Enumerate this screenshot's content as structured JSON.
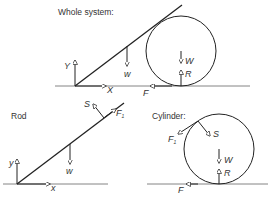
{
  "panels": {
    "whole_system": {
      "title": "Whole system:",
      "labels": {
        "Y": "Y",
        "X": "X",
        "w": "w",
        "W": "W",
        "R": "R",
        "F": "F"
      }
    },
    "rod": {
      "title": "Rod",
      "labels": {
        "y": "y",
        "x": "x",
        "w": "w",
        "S": "S",
        "F1": "F",
        "F1_sub": "1"
      }
    },
    "cylinder": {
      "title": "Cylinder:",
      "labels": {
        "F1": "F",
        "F1_sub": "1",
        "S": "S",
        "W": "W",
        "R": "R",
        "F": "F"
      }
    }
  },
  "colors": {
    "line": "#222222",
    "ground": "#555555",
    "text": "#333333"
  }
}
